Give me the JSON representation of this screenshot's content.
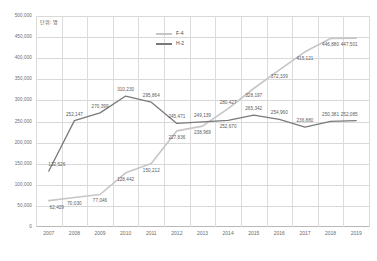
{
  "unit_caption": "단위: 명",
  "legend": {
    "position": "top-right-inside",
    "items": [
      {
        "label": "F-4",
        "color": "#c6c6c6"
      },
      {
        "label": "H-2",
        "color": "#7a7a7a"
      }
    ]
  },
  "axis": {
    "y_ticks": [
      "0",
      "50,000",
      "100,000",
      "150,000",
      "200,000",
      "250,000",
      "300,000",
      "350,000",
      "400,000",
      "450,000",
      "500,000"
    ],
    "x_ticks": [
      "2007",
      "2008",
      "2009",
      "2010",
      "2011",
      "2012",
      "2013",
      "2014",
      "2015",
      "2016",
      "2017",
      "2018",
      "2019"
    ]
  },
  "chart_data": {
    "type": "line",
    "title": "",
    "subtitle": "",
    "xlabel": "",
    "ylabel": "",
    "unit": "단위: 명",
    "grid": true,
    "legend_position": "top-right-inside",
    "ylim": [
      0,
      500000
    ],
    "ytick_step": 50000,
    "categories": [
      "2007",
      "2008",
      "2009",
      "2010",
      "2011",
      "2012",
      "2013",
      "2014",
      "2015",
      "2016",
      "2017",
      "2018",
      "2019"
    ],
    "series": [
      {
        "name": "F-4",
        "color": "#c6c6c6",
        "values": [
          62429,
          70030,
          77046,
          128442,
          150212,
          227836,
          238969,
          280427,
          328197,
          372339,
          415121,
          446880,
          447501
        ],
        "labels": [
          "62,429",
          "70,030",
          "77,046",
          "128,442",
          "150,212",
          "227,836",
          "238,969",
          "280,427",
          "328,197",
          "372,339",
          "415,121",
          "446,880",
          "447,501"
        ]
      },
      {
        "name": "H-2",
        "color": "#7a7a7a",
        "values": [
          132526,
          252147,
          270399,
          310230,
          295864,
          245471,
          249139,
          252670,
          265342,
          254960,
          236880,
          250381,
          252085
        ],
        "labels": [
          "132,526",
          "252,147",
          "270,399",
          "310,230",
          "295,864",
          "245,471",
          "249,139",
          "252,670",
          "265,342",
          "254,960",
          "236,880",
          "250,381",
          "252,085"
        ]
      }
    ]
  }
}
